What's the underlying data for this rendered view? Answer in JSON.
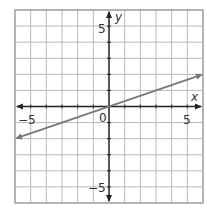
{
  "chart_data": {
    "type": "line",
    "title": "",
    "xlabel": "x",
    "ylabel": "y",
    "xlim": [
      -6,
      6
    ],
    "ylim": [
      -6,
      6
    ],
    "grid": true,
    "grid_step": 1,
    "x_ticks_labeled": [
      -5,
      0,
      5
    ],
    "y_ticks_labeled": [
      5,
      -5
    ],
    "tick_labels": {
      "x_neg": "−5",
      "origin": "0",
      "x_pos": "5",
      "y_pos": "5",
      "y_neg": "−5"
    },
    "series": [
      {
        "name": "line",
        "equation": "y = x/3",
        "x": [
          -6,
          -3,
          0,
          3,
          6
        ],
        "y": [
          -2,
          -1,
          0,
          1,
          2
        ],
        "arrows": "both",
        "color": "#777777"
      }
    ],
    "legend": null
  },
  "colors": {
    "grid": "#b8b8b8",
    "axis": "#222222",
    "line": "#7a7a7a",
    "border": "#999999"
  }
}
